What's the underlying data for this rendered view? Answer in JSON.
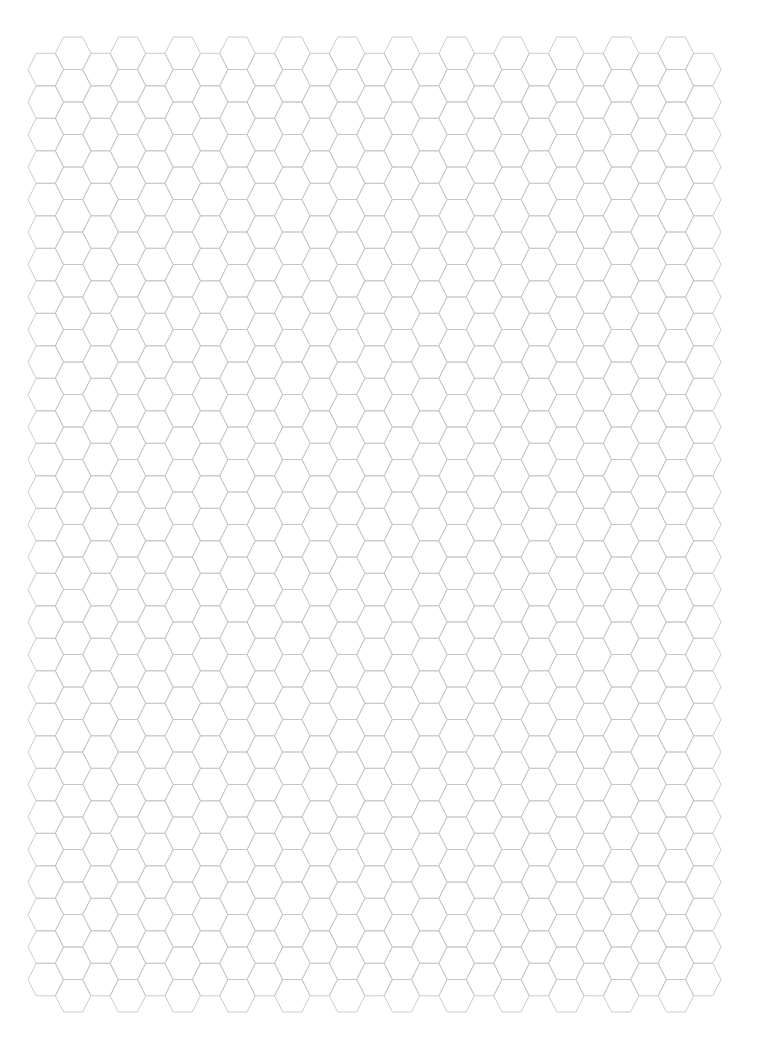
{
  "page": {
    "width": 769,
    "height": 1052,
    "background": "#ffffff"
  },
  "hex_grid": {
    "orientation": "flat-top",
    "line_color": "#c6c6c6",
    "columns": 25,
    "origin_x": 28,
    "column_step_x": 27.4,
    "hex_width": 35.4,
    "hex_inset": 8.2,
    "hex_height": 32.5,
    "even_column": {
      "top_y": 53.3,
      "rows": 29
    },
    "odd_column": {
      "top_y": 37.0,
      "rows": 30
    }
  }
}
